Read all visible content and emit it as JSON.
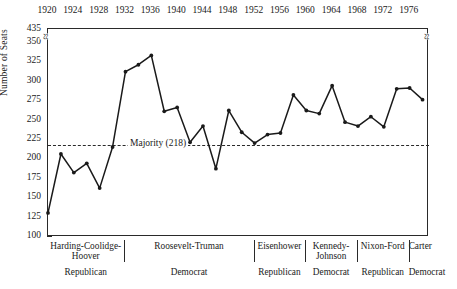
{
  "chart_data": {
    "type": "line",
    "title": "",
    "xlabel": "",
    "ylabel": "Number of Seats",
    "ylim": [
      100,
      350
    ],
    "y_break": {
      "above": 435,
      "note": "axis break between 350 and 435"
    },
    "yticks": [
      100,
      125,
      150,
      175,
      200,
      225,
      250,
      275,
      300,
      325,
      350,
      435
    ],
    "xticks": [
      1920,
      1924,
      1928,
      1932,
      1936,
      1940,
      1944,
      1948,
      1952,
      1956,
      1960,
      1964,
      1968,
      1972,
      1976
    ],
    "x": [
      1920,
      1922,
      1924,
      1926,
      1928,
      1930,
      1932,
      1934,
      1936,
      1938,
      1940,
      1942,
      1944,
      1946,
      1948,
      1950,
      1952,
      1954,
      1956,
      1958,
      1960,
      1962,
      1964,
      1966,
      1968,
      1970,
      1972,
      1974,
      1976,
      1978
    ],
    "values": [
      131,
      207,
      183,
      195,
      163,
      216,
      313,
      322,
      334,
      262,
      267,
      222,
      243,
      188,
      263,
      235,
      221,
      232,
      234,
      283,
      263,
      259,
      295,
      248,
      243,
      255,
      242,
      291,
      292,
      277
    ],
    "series": [
      {
        "name": "Democratic seats in the House of Representatives",
        "values": [
          131,
          207,
          183,
          195,
          163,
          216,
          313,
          322,
          334,
          262,
          267,
          222,
          243,
          188,
          263,
          235,
          221,
          232,
          234,
          283,
          263,
          259,
          295,
          248,
          243,
          255,
          242,
          291,
          292,
          277
        ]
      }
    ],
    "reference_line": {
      "value": 218,
      "label": "Majority (218)",
      "style": "dashed"
    },
    "grid": false,
    "legend": "none",
    "marker": "filled-circle",
    "line_color": "#1a1a1a"
  },
  "axis": {
    "y_title": "Number of Seats",
    "break_glyph": "≈",
    "y_labels": [
      "435",
      "350",
      "325",
      "300",
      "275",
      "250",
      "225",
      "200",
      "175",
      "150",
      "125",
      "100"
    ],
    "x_labels": [
      "1920",
      "1924",
      "1928",
      "1932",
      "1936",
      "1940",
      "1944",
      "1948",
      "1952",
      "1956",
      "1960",
      "1964",
      "1968",
      "1972",
      "1976"
    ]
  },
  "majority": {
    "label": "Majority (218)",
    "value": 218
  },
  "eras": [
    {
      "name": "Harding-Coolidge-Hoover",
      "party": "Republican",
      "start": 1920,
      "end": 1932
    },
    {
      "name": "Roosevelt-Truman",
      "party": "Democrat",
      "start": 1932,
      "end": 1952
    },
    {
      "name": "Eisenhower",
      "party": "Republican",
      "start": 1952,
      "end": 1960
    },
    {
      "name": "Kennedy-Johnson",
      "party": "Democrat",
      "start": 1960,
      "end": 1968
    },
    {
      "name": "Nixon-Ford",
      "party": "Republican",
      "start": 1968,
      "end": 1976
    },
    {
      "name": "Carter",
      "party": "Democrat",
      "start": 1976,
      "end": 1980
    }
  ],
  "caption": ""
}
